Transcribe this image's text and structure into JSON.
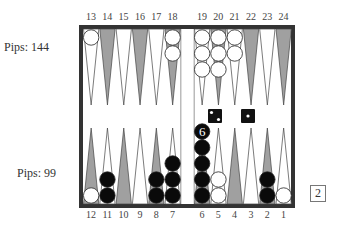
{
  "top_player": {
    "pips_label": "Pips: 144",
    "color": "white"
  },
  "bottom_player": {
    "pips_label": "Pips:  99",
    "color": "black"
  },
  "labels": {
    "top": [
      "13",
      "14",
      "15",
      "16",
      "17",
      "18",
      "19",
      "20",
      "21",
      "22",
      "23",
      "24"
    ],
    "bottom": [
      "12",
      "11",
      "10",
      "9",
      "8",
      "7",
      "6",
      "5",
      "4",
      "3",
      "2",
      "1"
    ]
  },
  "position": {
    "white": {
      "13": 1,
      "18": 2,
      "19": 3,
      "20": 3,
      "21": 2,
      "12": 1,
      "5": 2,
      "1": 1
    },
    "black": {
      "11": 2,
      "8": 2,
      "7": 3,
      "6": 6,
      "2": 2
    }
  },
  "stack_count_label": {
    "point": "6",
    "text": "6"
  },
  "dice": [
    {
      "value": 2,
      "color": "black"
    },
    {
      "value": 1,
      "color": "black"
    }
  ],
  "cube": {
    "value": "2"
  },
  "colors": {
    "frame": "#333333",
    "point_dark": "#a0a0a0",
    "point_light": "#ffffff",
    "checker_white": "#ffffff",
    "checker_black": "#0a0a0a"
  }
}
